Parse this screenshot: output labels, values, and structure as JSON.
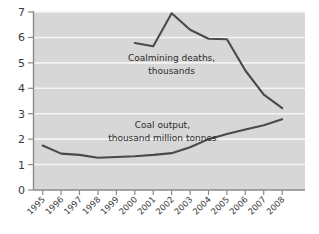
{
  "chart_data": {
    "type": "line",
    "title": "",
    "xlabel": "",
    "ylabel": "",
    "grid": "horizontal-white",
    "legend": "inline-annotations",
    "plot_background": "#d7d7d7",
    "line_color": "#4a4a4a",
    "categories": [
      "1995",
      "1996",
      "1997",
      "1998",
      "1999",
      "2000",
      "2001",
      "2002",
      "2003",
      "2004",
      "2005",
      "2006",
      "2007",
      "2008"
    ],
    "x": [
      1995,
      1996,
      1997,
      1998,
      1999,
      2000,
      2001,
      2002,
      2003,
      2004,
      2005,
      2006,
      2007,
      2008
    ],
    "ylim": [
      0,
      7
    ],
    "yticks": [
      0,
      1,
      2,
      3,
      4,
      5,
      6,
      7
    ],
    "ytick_labels": [
      "0",
      "1",
      "2",
      "3",
      "4",
      "5",
      "6",
      "7"
    ],
    "series": [
      {
        "name": "Coalmining deaths, thousands",
        "label_line1": "Coalmining deaths,",
        "label_line2": "thousands",
        "x": [
          2000,
          2001,
          2002,
          2003,
          2004,
          2005,
          2006,
          2007,
          2008
        ],
        "values": [
          5.78,
          5.65,
          6.95,
          6.3,
          5.95,
          5.93,
          4.7,
          3.75,
          3.22
        ]
      },
      {
        "name": "Coal output, thousand million tonnes",
        "label_line1": "Coal output,",
        "label_line2": "thousand million tonnes",
        "x": [
          1995,
          1996,
          1997,
          1998,
          1999,
          2000,
          2001,
          2002,
          2003,
          2004,
          2005,
          2006,
          2007,
          2008
        ],
        "values": [
          1.75,
          1.43,
          1.38,
          1.27,
          1.3,
          1.33,
          1.38,
          1.45,
          1.68,
          2.0,
          2.2,
          2.38,
          2.55,
          2.78
        ]
      }
    ],
    "annotations": [
      {
        "text": "Coalmining deaths,",
        "x": 2002.0,
        "y": 5.05
      },
      {
        "text": "thousands",
        "x": 2002.0,
        "y": 4.55
      },
      {
        "text": "Coal output,",
        "x": 2001.5,
        "y": 2.4
      },
      {
        "text": "thousand million tonnes",
        "x": 2001.5,
        "y": 1.92
      }
    ]
  }
}
